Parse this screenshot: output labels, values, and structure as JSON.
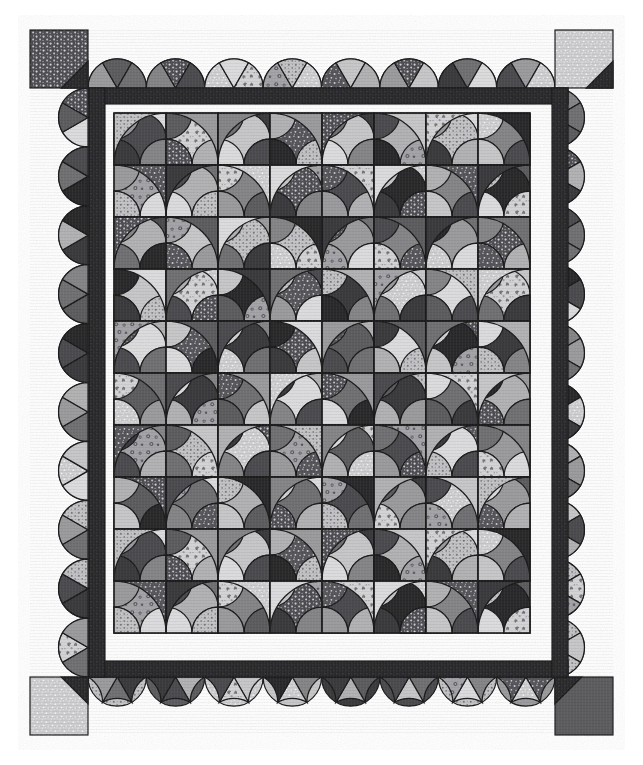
{
  "artwork": {
    "title": "Winding Ways Patchwork Quilt",
    "medium": "Photograph of a pieced cotton quilt",
    "rendering": "grayscale",
    "canvas": {
      "width": 643,
      "height": 765,
      "background": "#ffffff"
    }
  },
  "palette": {
    "background": "#ffffff",
    "seam_line": "#1c1c1c",
    "sashing_dark": "#2b2b2d",
    "sashing_dark_alt": "#313134",
    "tones": {
      "black": "#2a2a2c",
      "charcoal": "#3b3b3e",
      "dark_gray": "#4d4d50",
      "mid_dark": "#5e5e61",
      "mid_gray": "#727275",
      "mid_light": "#87878a",
      "light_gray": "#9d9da0",
      "pale_gray": "#b4b4b6",
      "very_pale": "#c9c9cb",
      "near_white": "#dedee0"
    },
    "prints": {
      "dot_dark": "#55555a",
      "dot_light": "#c2c2c5",
      "floral_light": "#d4d4d6",
      "floral_mid": "#a8a8ab",
      "speckle_light": "#cfcfd2",
      "speckle_dark": "#5a5a5e"
    }
  },
  "layout": {
    "quilt_bounds": {
      "x": 30,
      "y": 30,
      "width": 583,
      "height": 705
    },
    "border_band": {
      "thickness": 58,
      "description": "outer scalloped pieced border"
    },
    "sashing_frame": {
      "thickness": 16,
      "top_y": 88,
      "bottom_y": 661,
      "left_x": 89,
      "right_x": 552,
      "color_key": "sashing_dark"
    },
    "inner_field": {
      "x": 114,
      "y": 113,
      "width": 415,
      "height": 525,
      "columns": 8,
      "rows": 10,
      "block_size": 52
    },
    "corner_squares": [
      {
        "name": "top-left",
        "fill": "dot_dark",
        "notch": "bottom-right"
      },
      {
        "name": "top-right",
        "fill": "speckle_light",
        "notch": "bottom-right"
      },
      {
        "name": "bottom-left",
        "fill": "speckle_light",
        "notch": "top-right"
      },
      {
        "name": "bottom-right",
        "fill": "mid_dark",
        "notch": "top-left"
      }
    ]
  },
  "block_pattern": {
    "name": "winding-ways",
    "description": "Square block with two opposing quarter-circle arcs forming a pinwheel of four curved wedges",
    "wedges_per_block": 4
  },
  "fabric_sequence": [
    "dark_gray",
    "light_gray",
    "mid_gray",
    "near_white",
    "charcoal",
    "dot_light",
    "mid_light",
    "floral_light",
    "mid_dark",
    "pale_gray",
    "black",
    "speckle_light",
    "light_gray",
    "dot_dark",
    "very_pale",
    "mid_gray",
    "floral_mid",
    "charcoal",
    "near_white",
    "mid_light",
    "dark_gray",
    "speckle_dark",
    "pale_gray",
    "dot_light",
    "mid_dark",
    "floral_light",
    "light_gray",
    "black",
    "very_pale",
    "mid_gray",
    "speckle_light",
    "charcoal",
    "near_white",
    "dot_dark",
    "mid_light",
    "pale_gray",
    "dark_gray",
    "floral_mid",
    "mid_gray",
    "speckle_dark",
    "very_pale",
    "black",
    "dot_light",
    "light_gray",
    "mid_dark",
    "near_white",
    "charcoal",
    "floral_light",
    "pale_gray",
    "mid_light",
    "speckle_light",
    "dark_gray",
    "mid_gray",
    "dot_dark",
    "black",
    "very_pale",
    "floral_mid",
    "light_gray",
    "near_white",
    "charcoal",
    "mid_dark",
    "speckle_dark",
    "dot_light",
    "pale_gray"
  ],
  "border_scallops": {
    "top_count": 8,
    "bottom_count": 8,
    "left_count": 10,
    "right_count": 10,
    "wedges_per_scallop": 3
  }
}
